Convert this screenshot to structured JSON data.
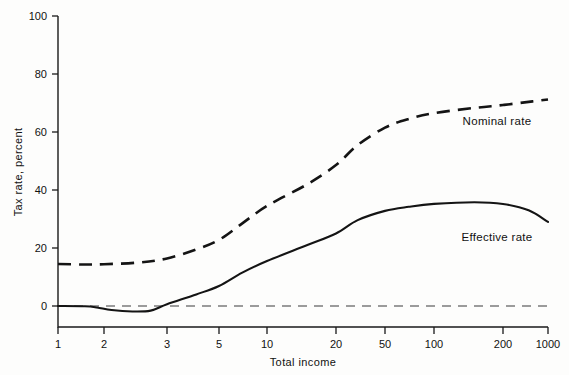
{
  "chart_data": {
    "type": "line",
    "title": "",
    "xlabel": "Total income",
    "ylabel": "Tax rate, percent",
    "xscale": "log",
    "xlim": [
      1,
      1000
    ],
    "ylim": [
      0,
      100
    ],
    "grid": false,
    "legend_position": "inline-right",
    "xticks": [
      {
        "label": "1",
        "value": 1,
        "px": 58
      },
      {
        "label": "2",
        "value": 2,
        "px": 104
      },
      {
        "label": "3",
        "value": 3,
        "px": 167
      },
      {
        "label": "5",
        "value": 5,
        "px": 219
      },
      {
        "label": "10",
        "value": 10,
        "px": 267
      },
      {
        "label": "20",
        "value": 20,
        "px": 336
      },
      {
        "label": "50",
        "value": 50,
        "px": 385
      },
      {
        "label": "100",
        "value": 100,
        "px": 434
      },
      {
        "label": "200",
        "value": 200,
        "px": 503
      },
      {
        "label": "1000",
        "value": 1000,
        "px": 548
      }
    ],
    "yticks": [
      {
        "label": "0",
        "value": 0
      },
      {
        "label": "20",
        "value": 20
      },
      {
        "label": "40",
        "value": 40
      },
      {
        "label": "60",
        "value": 60
      },
      {
        "label": "80",
        "value": 80
      },
      {
        "label": "100",
        "value": 100
      }
    ],
    "annotations": [
      {
        "text": "Nominal rate",
        "x_px": 497,
        "y_px": 125
      },
      {
        "text": "Effective rate",
        "x_px": 497,
        "y_px": 241
      }
    ],
    "reference_lines": [
      {
        "name": "zero",
        "value": 0,
        "style": "dashed"
      }
    ],
    "series": [
      {
        "name": "Nominal rate",
        "style": "dashed",
        "points": [
          {
            "income": 1,
            "rate": 14.5
          },
          {
            "income": 1.5,
            "rate": 14.3
          },
          {
            "income": 2,
            "rate": 14.4
          },
          {
            "income": 2.5,
            "rate": 15.0
          },
          {
            "income": 3,
            "rate": 16.4
          },
          {
            "income": 4,
            "rate": 19.5
          },
          {
            "income": 5,
            "rate": 22.8
          },
          {
            "income": 7,
            "rate": 28.5
          },
          {
            "income": 10,
            "rate": 34.5
          },
          {
            "income": 15,
            "rate": 42.0
          },
          {
            "income": 20,
            "rate": 48.6
          },
          {
            "income": 30,
            "rate": 55.5
          },
          {
            "income": 50,
            "rate": 61.5
          },
          {
            "income": 70,
            "rate": 64.5
          },
          {
            "income": 100,
            "rate": 66.5
          },
          {
            "income": 150,
            "rate": 68.3
          },
          {
            "income": 200,
            "rate": 69.3
          },
          {
            "income": 500,
            "rate": 70.4
          },
          {
            "income": 1000,
            "rate": 71.2
          }
        ]
      },
      {
        "name": "Effective rate",
        "style": "solid",
        "points": [
          {
            "income": 1,
            "rate": 0.0
          },
          {
            "income": 1.5,
            "rate": -0.1
          },
          {
            "income": 1.8,
            "rate": -0.5
          },
          {
            "income": 2.1,
            "rate": -1.4
          },
          {
            "income": 2.4,
            "rate": -1.9
          },
          {
            "income": 2.7,
            "rate": -1.6
          },
          {
            "income": 3.0,
            "rate": 0.6
          },
          {
            "income": 4,
            "rate": 4.0
          },
          {
            "income": 5,
            "rate": 6.9
          },
          {
            "income": 7,
            "rate": 11.5
          },
          {
            "income": 10,
            "rate": 15.5
          },
          {
            "income": 15,
            "rate": 21.0
          },
          {
            "income": 20,
            "rate": 25.0
          },
          {
            "income": 30,
            "rate": 29.6
          },
          {
            "income": 50,
            "rate": 32.8
          },
          {
            "income": 70,
            "rate": 34.2
          },
          {
            "income": 100,
            "rate": 35.2
          },
          {
            "income": 150,
            "rate": 35.8
          },
          {
            "income": 200,
            "rate": 35.2
          },
          {
            "income": 500,
            "rate": 33.0
          },
          {
            "income": 1000,
            "rate": 29.0
          }
        ]
      }
    ]
  },
  "labels": {
    "y_axis_title": "Tax rate, percent",
    "x_axis_title": "Total income",
    "nominal": "Nominal rate",
    "effective": "Effective rate"
  }
}
